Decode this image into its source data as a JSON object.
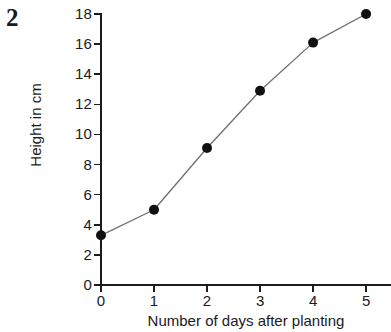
{
  "question": {
    "number": "2"
  },
  "chart_data": {
    "type": "line",
    "title": "",
    "xlabel": "Number of days after planting",
    "ylabel": "Height in cm",
    "x": [
      0,
      1,
      2,
      3,
      4,
      5
    ],
    "values": [
      3.3,
      5.0,
      9.1,
      12.9,
      16.1,
      18.0
    ],
    "series": [
      {
        "name": "Plant height",
        "values": [
          3.3,
          5.0,
          9.1,
          12.9,
          16.1,
          18.0
        ]
      }
    ],
    "xlim": [
      0,
      5.47
    ],
    "ylim": [
      0,
      18
    ],
    "xticks": [
      0,
      1,
      2,
      3,
      4,
      5
    ],
    "yticks": [
      0,
      2,
      4,
      6,
      8,
      10,
      12,
      14,
      16,
      18
    ],
    "xtick_labels": [
      "0",
      "1",
      "2",
      "3",
      "4",
      "5"
    ],
    "ytick_labels": [
      "0",
      "2",
      "4",
      "6",
      "8",
      "10",
      "12",
      "14",
      "16",
      "18"
    ],
    "grid": false,
    "legend": false,
    "legend_position": "none",
    "marker": "filled-circle",
    "line_color": "#6f6f6f",
    "marker_color": "#111111",
    "axis_color": "#1c1c1c",
    "background_color": "#ffffff"
  }
}
